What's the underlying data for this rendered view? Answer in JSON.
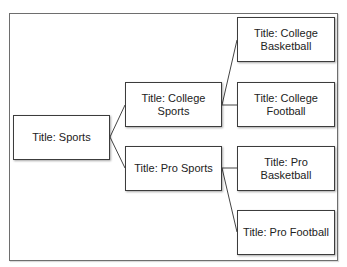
{
  "diagram": {
    "type": "tree",
    "root": {
      "title": "Title: Sports",
      "children": [
        {
          "title": "Title: College\nSports",
          "children": [
            {
              "title": "Title: College\nBasketball"
            },
            {
              "title": "Title: College\nFootball"
            }
          ]
        },
        {
          "title": "Title: Pro Sports",
          "children": [
            {
              "title": "Title: Pro Basketball"
            },
            {
              "title": "Title: Pro Football"
            }
          ]
        }
      ]
    },
    "colors": {
      "border": "#3c3c3c",
      "frame": "#6e6e6e",
      "link": "#444444",
      "background": "#ffffff"
    }
  }
}
